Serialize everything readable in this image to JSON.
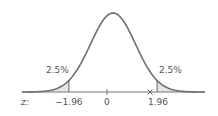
{
  "chart_data": {
    "type": "area",
    "title": "",
    "xlabel": "z:",
    "ylabel": "",
    "x_ticks": [
      "-1.96",
      "0",
      "1.96"
    ],
    "critical_values": [
      -1.96,
      1.96
    ],
    "tail_areas": [
      {
        "side": "left",
        "label": "2.5%",
        "value": 0.025
      },
      {
        "side": "right",
        "label": "2.5%",
        "value": 0.025
      }
    ],
    "marker": {
      "symbol": "×",
      "approx_z": 1.75
    },
    "grid": false,
    "legend": false
  },
  "labels": {
    "left_tail": "2.5%",
    "right_tail": "2.5%",
    "axis_name": "z:",
    "tick_neg": "−1.96",
    "tick_zero": "0",
    "tick_pos": "1.96"
  },
  "colors": {
    "curve": "#6e6e6e",
    "axis": "#777777",
    "shade": "#e6e6e6",
    "text": "#555555"
  }
}
